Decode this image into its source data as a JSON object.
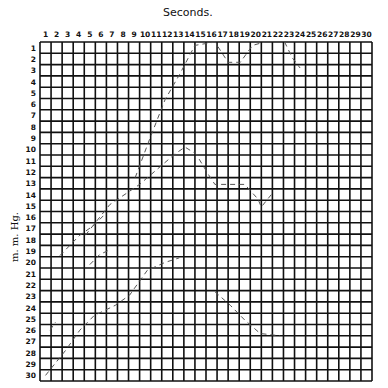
{
  "chart_data": {
    "type": "line",
    "title": "Seconds.",
    "xlabel": "Seconds.",
    "ylabel": "m. m. Hg.",
    "x_ticks": [
      "1",
      "2",
      "3",
      "4",
      "5",
      "6",
      "7",
      "8",
      "9",
      "10",
      "11",
      "12",
      "13",
      "14",
      "15",
      "16",
      "17",
      "18",
      "19",
      "20",
      "21",
      "22",
      "23",
      "24",
      "25",
      "26",
      "27",
      "28",
      "29",
      "30"
    ],
    "y_ticks": [
      "1",
      "2",
      "3",
      "4",
      "5",
      "6",
      "7",
      "8",
      "9",
      "10",
      "11",
      "12",
      "13",
      "14",
      "15",
      "16",
      "17",
      "18",
      "19",
      "20",
      "21",
      "22",
      "23",
      "24",
      "25",
      "26",
      "27",
      "28",
      "29",
      "30"
    ],
    "xlim": [
      0,
      30
    ],
    "ylim": [
      30,
      0
    ],
    "grid": true,
    "grid_box": {
      "left": 40,
      "top": 42,
      "right": 372,
      "bottom": 381
    },
    "series": [
      {
        "name": "trace-1",
        "points": [
          [
            8.6,
            12.0
          ],
          [
            9.9,
            8.6
          ],
          [
            11.3,
            5.1
          ],
          [
            12.6,
            2.9
          ],
          [
            14.0,
            0.3
          ],
          [
            15.8,
            0.0
          ],
          [
            17.0,
            1.8
          ],
          [
            18.1,
            1.8
          ],
          [
            19.2,
            0.3
          ],
          [
            20.3,
            0.0
          ]
        ]
      },
      {
        "name": "trace-1b",
        "points": [
          [
            22.1,
            0.0
          ],
          [
            22.8,
            1.4
          ],
          [
            23.5,
            2.3
          ]
        ]
      },
      {
        "name": "trace-2",
        "points": [
          [
            4.1,
            17.1
          ],
          [
            6.3,
            14.4
          ],
          [
            9.0,
            12.6
          ],
          [
            12.2,
            9.9
          ],
          [
            13.1,
            9.3
          ],
          [
            14.1,
            9.9
          ],
          [
            15.2,
            11.7
          ],
          [
            15.8,
            12.6
          ],
          [
            18.5,
            12.6
          ],
          [
            19.7,
            13.9
          ],
          [
            20.0,
            14.6
          ],
          [
            20.9,
            13.5
          ]
        ]
      },
      {
        "name": "trace-3",
        "points": [
          [
            1.8,
            18.9
          ],
          [
            3.6,
            17.1
          ],
          [
            4.9,
            16.2
          ],
          [
            5.8,
            15.3
          ]
        ]
      },
      {
        "name": "trace-4",
        "points": [
          [
            0.5,
            29.5
          ],
          [
            2.3,
            27.3
          ],
          [
            3.6,
            25.5
          ],
          [
            4.9,
            24.2
          ],
          [
            6.8,
            23.3
          ],
          [
            8.1,
            22.4
          ],
          [
            9.7,
            20.2
          ],
          [
            11.3,
            19.5
          ],
          [
            12.6,
            19.1
          ]
        ]
      },
      {
        "name": "trace-5",
        "points": [
          [
            15.8,
            22.1
          ],
          [
            17.2,
            23.3
          ],
          [
            18.5,
            24.6
          ],
          [
            19.9,
            25.8
          ],
          [
            21.7,
            26.0
          ]
        ]
      },
      {
        "name": "trace-6",
        "points": [
          [
            0.9,
            25.5
          ],
          [
            1.4,
            24.8
          ]
        ]
      },
      {
        "name": "trace-7",
        "points": [
          [
            4.5,
            19.7
          ],
          [
            5.4,
            18.8
          ],
          [
            6.3,
            18.4
          ]
        ]
      }
    ]
  },
  "labels": {
    "title": "Seconds.",
    "ylabel": "m. m. Hg."
  }
}
